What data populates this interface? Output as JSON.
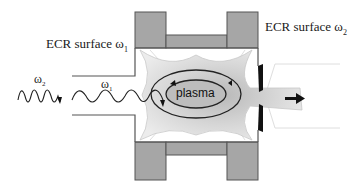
{
  "labels": {
    "ecr_surface_1": {
      "text": "ECR surface ω",
      "sub": "1"
    },
    "ecr_surface_2": {
      "text": "ECR surface ω",
      "sub": "2"
    },
    "wave_2": {
      "text": "ω",
      "sub": "2"
    },
    "wave_1": {
      "text": "ω",
      "sub": "1"
    },
    "plasma": "plasma"
  },
  "colors": {
    "magnet_fill": "#a6a6a6",
    "magnet_stroke": "#555555",
    "chamber_line": "#555555",
    "plasma_fill": "#d9d9d9",
    "plasma_core": "#bdbdbd",
    "electrode": "#111111",
    "wave": "#222222"
  },
  "components": [
    "microwave ω2",
    "microwave ω1",
    "waveguide",
    "magnet coils",
    "plasma chamber",
    "ECR surfaces",
    "extraction electrode",
    "ion beam"
  ]
}
